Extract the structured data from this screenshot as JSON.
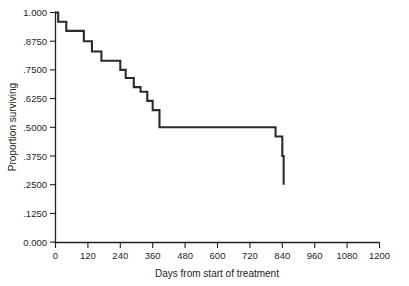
{
  "chart_data": {
    "type": "line",
    "title": "",
    "subtitle": "",
    "xlabel": "Days from start of treatment",
    "ylabel": "Proportion surviving",
    "xlim": [
      0,
      1200
    ],
    "ylim": [
      0,
      1.0
    ],
    "grid": false,
    "legend": false,
    "style": "kaplan-meier step function",
    "xticks": [
      0,
      120,
      240,
      360,
      480,
      600,
      720,
      840,
      960,
      1080,
      1200
    ],
    "xtick_labels": [
      "0",
      "120",
      "240",
      "360",
      "480",
      "600",
      "720",
      "840",
      "960",
      "1080",
      "1200"
    ],
    "yticks": [
      0.0,
      0.125,
      0.25,
      0.375,
      0.5,
      0.625,
      0.75,
      0.875,
      1.0
    ],
    "ytick_labels": [
      "0.000",
      ".1250",
      ".2500",
      ".3750",
      ".5000",
      ".6250",
      ".7500",
      ".8750",
      "1.000"
    ],
    "series": [
      {
        "name": "Proportion surviving",
        "step": "post",
        "x": [
          0,
          10,
          40,
          75,
          105,
          135,
          170,
          200,
          240,
          260,
          290,
          315,
          340,
          360,
          385,
          540,
          815,
          840,
          845
        ],
        "y": [
          1.0,
          0.96,
          0.92,
          0.92,
          0.875,
          0.83,
          0.79,
          0.79,
          0.75,
          0.715,
          0.675,
          0.655,
          0.615,
          0.575,
          0.5,
          0.5,
          0.46,
          0.375,
          0.25
        ]
      }
    ],
    "annotations": []
  }
}
